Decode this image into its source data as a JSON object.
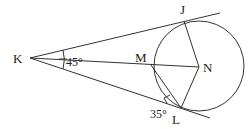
{
  "diagram": {
    "points": {
      "K": {
        "label": "K",
        "x": 30,
        "y": 58
      },
      "J": {
        "label": "J",
        "x": 184,
        "y": 21
      },
      "M": {
        "label": "M",
        "x": 151,
        "y": 65
      },
      "N": {
        "label": "N",
        "x": 199,
        "y": 67
      },
      "L": {
        "label": "L",
        "x": 181,
        "y": 108
      }
    },
    "circle": {
      "center": "N",
      "cx": 199,
      "cy": 66,
      "r": 45
    },
    "angles": {
      "K": {
        "label": "45°"
      },
      "L": {
        "label": "35°"
      }
    },
    "color": "#333333"
  }
}
